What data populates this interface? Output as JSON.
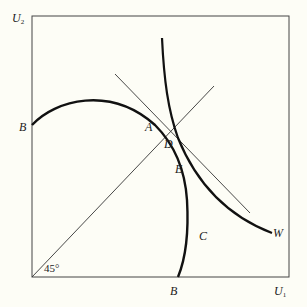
{
  "diagram": {
    "axes": {
      "y_label": "U",
      "y_sub": "2",
      "x_label": "U",
      "x_sub": "1",
      "angle_label": "45°"
    },
    "points": {
      "B_left": "B",
      "B_bottom": "B",
      "A": "A",
      "D": "D",
      "E": "E",
      "C": "C",
      "W": "W"
    },
    "colors": {
      "background": "#fdfdf6",
      "ink": "#1a1a1a"
    }
  }
}
